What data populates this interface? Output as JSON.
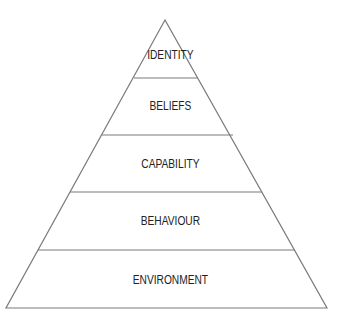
{
  "diagram": {
    "type": "pyramid",
    "colors": {
      "line": "#7a7a7a",
      "text": "#222222",
      "background": "#ffffff"
    },
    "levels_top_to_bottom": [
      {
        "label": "IDENTITY"
      },
      {
        "label": "BELIEFS"
      },
      {
        "label": "CAPABILITY"
      },
      {
        "label": "BEHAVIOUR"
      },
      {
        "label": "ENVIRONMENT"
      }
    ]
  }
}
